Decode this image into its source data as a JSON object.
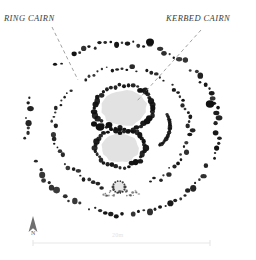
{
  "figure": {
    "type": "archaeological-site-plan",
    "background_color": "#ffffff",
    "stone_color": "#111111",
    "cairn_fill_color": "#e2e2e2",
    "leader_color": "#8a8a8a"
  },
  "annotations": [
    {
      "id": "ring-cairn",
      "label": "RING CAIRN",
      "label_x": 4,
      "label_y": 13,
      "leader": {
        "x1": 52,
        "y1": 27,
        "x2": 78,
        "y2": 80,
        "style": "dashed"
      }
    },
    {
      "id": "kerbed-cairn",
      "label": "KERBED CAIRN",
      "label_x": 166,
      "label_y": 13,
      "leader": {
        "x1": 201,
        "y1": 30,
        "x2": 137,
        "y2": 101,
        "style": "dashed"
      }
    }
  ],
  "north_arrow": {
    "label": "N",
    "x": 33,
    "y": 216,
    "icon": "north-arrow-icon"
  },
  "scale_bar": {
    "label": "20m",
    "x1": 33,
    "x2": 210,
    "y": 243,
    "color": "#e8e8e8"
  },
  "features": {
    "outer_ring": {
      "name": "outer-stone-ring",
      "cx": 122,
      "cy": 128,
      "rx": 96,
      "ry": 86,
      "stone_count": 108
    },
    "inner_ring": {
      "name": "inner-stone-ring",
      "cx": 122,
      "cy": 128,
      "rx": 68,
      "ry": 60,
      "stone_count": 86
    },
    "kerbed_cairn_north": {
      "name": "kerbed-cairn-upper",
      "cx": 124,
      "cy": 108,
      "rx": 29,
      "ry": 23,
      "stone_count": 40
    },
    "kerbed_cairn_south": {
      "name": "kerbed-cairn-lower",
      "cx": 120,
      "cy": 148,
      "rx": 25,
      "ry": 19,
      "stone_count": 36
    },
    "small_setting": {
      "name": "small-stone-setting",
      "cx": 119,
      "cy": 187,
      "r": 6,
      "stone_count": 14
    },
    "large_stones": [
      {
        "cx": 210,
        "cy": 104,
        "r": 4.2
      },
      {
        "cx": 150,
        "cy": 42,
        "r": 4.0
      },
      {
        "cx": 100,
        "cy": 127,
        "r": 4.4
      },
      {
        "cx": 109,
        "cy": 125,
        "r": 3.4
      },
      {
        "cx": 94,
        "cy": 124,
        "r": 3.0
      },
      {
        "cx": 120,
        "cy": 133,
        "r": 2.4
      }
    ]
  }
}
